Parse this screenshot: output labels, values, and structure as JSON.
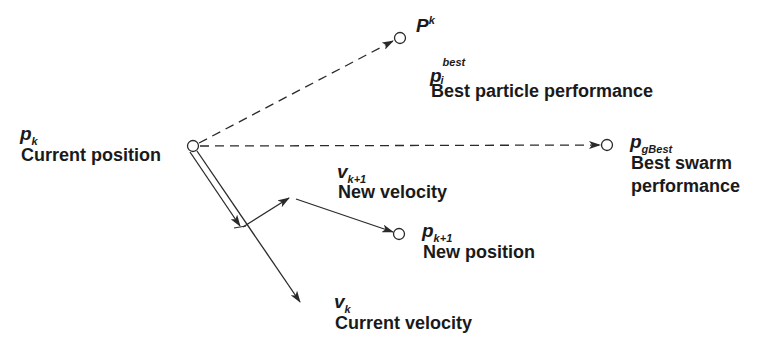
{
  "diagram": {
    "colors": {
      "line": "#2a2a2a",
      "background": "#ffffff"
    },
    "nodes": {
      "current_position": {
        "symbol": "p",
        "subscript": "k",
        "label": "Current position"
      },
      "particle_best_marker": {
        "symbol": "P",
        "superscript": "k"
      },
      "particle_best": {
        "symbol": "p",
        "subscript": "i",
        "superscript": "best",
        "label": "Best particle performance"
      },
      "swarm_best": {
        "symbol": "p",
        "subscript": "gBest",
        "label_line1": "Best swarm",
        "label_line2": "performance"
      },
      "new_velocity": {
        "symbol": "v",
        "subscript": "k+1",
        "label": "New velocity"
      },
      "new_position": {
        "symbol": "p",
        "subscript": "k+1",
        "label": "New position"
      },
      "current_velocity": {
        "symbol": "v",
        "subscript": "k",
        "label": "Current velocity"
      }
    }
  }
}
